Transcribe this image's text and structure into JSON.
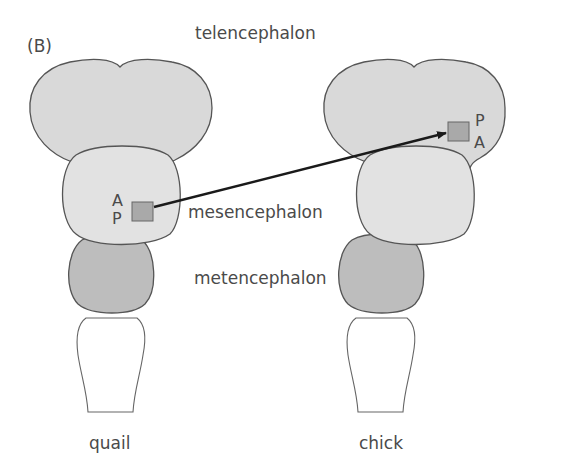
{
  "figure": {
    "panel_label": "(B)",
    "region_labels": {
      "telencephalon": "telencephalon",
      "mesencephalon": "mesencephalon",
      "metencephalon": "metencephalon"
    },
    "species": {
      "left": "quail",
      "right": "chick"
    },
    "graft_orientation": {
      "quail": {
        "top": "A",
        "bottom": "P"
      },
      "chick": {
        "top": "P",
        "bottom": "A"
      }
    },
    "colors": {
      "telencephalon": "#d9d9d9",
      "mesencephalon": "#e2e2e2",
      "metencephalon": "#bdbdbd",
      "graft": "#a9a9a9",
      "outline": "#555555",
      "arrow": "#1a1a1a"
    }
  }
}
